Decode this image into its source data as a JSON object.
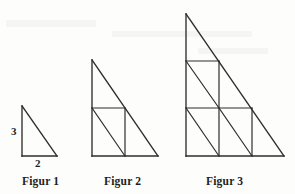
{
  "page": {
    "background_color": "#fdfdfc",
    "ink_color": "#2e2c2b",
    "width": 295,
    "height": 194
  },
  "figures": [
    {
      "id": "figure-1",
      "caption": "Figur 1",
      "scale": 1,
      "base_label": "2",
      "height_label": "3",
      "small_triangles": 1,
      "caption_x": 22,
      "caption_y": 176
    },
    {
      "id": "figure-2",
      "caption": "Figur 2",
      "scale": 2,
      "base_label": "",
      "height_label": "",
      "small_triangles": 4,
      "caption_x": 104,
      "caption_y": 176
    },
    {
      "id": "figure-3",
      "caption": "Figur 3",
      "scale": 3,
      "base_label": "",
      "height_label": "",
      "small_triangles": 9,
      "caption_x": 206,
      "caption_y": 176
    }
  ],
  "labels": {
    "height_3": "3",
    "base_2": "2"
  }
}
